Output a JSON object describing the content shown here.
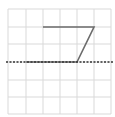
{
  "diagram": {
    "type": "grid-figure",
    "grid": {
      "columns": 6,
      "rows": 6,
      "x_lines": [
        8,
        26,
        43,
        60,
        77,
        94,
        111
      ],
      "y_lines": [
        9,
        27,
        44,
        62,
        80,
        97,
        114
      ],
      "color": "#d9d9d9"
    },
    "shape": {
      "name": "parallelogram",
      "points": "43,27 94,27 77,62 26,62",
      "stroke": "#6b6b6b"
    },
    "line_of_symmetry": {
      "style": "dashed",
      "y": 62,
      "x1": 6,
      "x2": 113,
      "stroke": "#333333"
    }
  }
}
